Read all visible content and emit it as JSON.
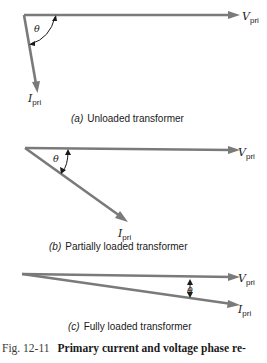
{
  "diagrams": [
    {
      "id": "a",
      "caption_letter": "(a)",
      "caption_text": "Unloaded transformer",
      "voltage_label": "V",
      "voltage_sub": "pri",
      "current_label": "I",
      "current_sub": "pri",
      "angle_label": "θ",
      "angle_deg": 80
    },
    {
      "id": "b",
      "caption_letter": "(b)",
      "caption_text": "Partially loaded transformer",
      "voltage_label": "V",
      "voltage_sub": "pri",
      "current_label": "I",
      "current_sub": "pri",
      "angle_label": "θ",
      "angle_deg": 36
    },
    {
      "id": "c",
      "caption_letter": "(c)",
      "caption_text": "Fully loaded transformer",
      "voltage_label": "V",
      "voltage_sub": "pri",
      "current_label": "I",
      "current_sub": "pri",
      "angle_label": "θ",
      "angle_deg": 8
    }
  ],
  "figure": {
    "number": "Fig. 12-11",
    "title": "Primary current and voltage phase re-"
  }
}
